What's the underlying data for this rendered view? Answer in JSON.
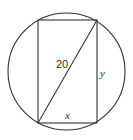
{
  "diagram": {
    "labels": {
      "diagonal": "20",
      "height": "y",
      "width": "x"
    },
    "colors": {
      "stroke": "#333333",
      "background": "#ffffff"
    }
  }
}
